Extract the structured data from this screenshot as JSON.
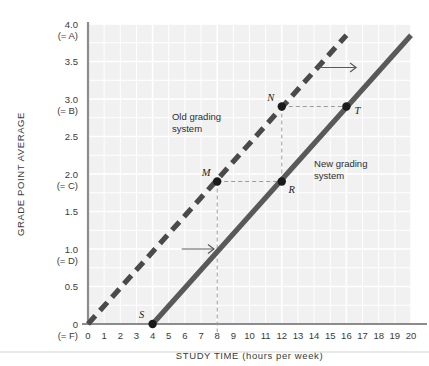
{
  "chart_data": {
    "type": "line",
    "title": "",
    "xlabel": "STUDY TIME (hours per week)",
    "ylabel": "GRADE POINT AVERAGE",
    "xlim": [
      0,
      20
    ],
    "ylim": [
      0,
      4.0
    ],
    "grid": true,
    "legend_position": "inline-annotations",
    "x_ticks": [
      "0",
      "1",
      "2",
      "3",
      "4",
      "5",
      "6",
      "7",
      "8",
      "9",
      "10",
      "11",
      "12",
      "13",
      "14",
      "15",
      "16",
      "17",
      "18",
      "19",
      "20"
    ],
    "x_tick_values": [
      0,
      1,
      2,
      3,
      4,
      5,
      6,
      7,
      8,
      9,
      10,
      11,
      12,
      13,
      14,
      15,
      16,
      17,
      18,
      19,
      20
    ],
    "y_ticks": [
      {
        "value": 4.0,
        "primary": "4.0",
        "secondary": "(= A)"
      },
      {
        "value": 3.5,
        "primary": "3.5",
        "secondary": ""
      },
      {
        "value": 3.0,
        "primary": "3.0",
        "secondary": "(= B)"
      },
      {
        "value": 2.5,
        "primary": "2.5",
        "secondary": ""
      },
      {
        "value": 2.0,
        "primary": "2.0",
        "secondary": "(= C)"
      },
      {
        "value": 1.5,
        "primary": "1.5",
        "secondary": ""
      },
      {
        "value": 1.0,
        "primary": "1.0",
        "secondary": "(= D)"
      },
      {
        "value": 0.5,
        "primary": "0.5",
        "secondary": ""
      },
      {
        "value": 0.0,
        "primary": "0",
        "secondary": "(= F)"
      }
    ],
    "series": [
      {
        "name": "Old grading system",
        "style": "dashed",
        "color": "#4a4a4a",
        "x": [
          0,
          16
        ],
        "values": [
          0,
          3.85
        ],
        "slope": 0.2408,
        "intercept": 0
      },
      {
        "name": "New grading system",
        "style": "solid",
        "color": "#595959",
        "x": [
          4,
          20
        ],
        "values": [
          0,
          3.85
        ],
        "slope": 0.2408,
        "intercept": -0.963
      }
    ],
    "points": [
      {
        "label": "S",
        "x": 4,
        "y": 0,
        "series": "New grading system"
      },
      {
        "label": "M",
        "x": 8,
        "y": 1.9,
        "series": "Old grading system"
      },
      {
        "label": "N",
        "x": 12,
        "y": 2.9,
        "series": "Old grading system"
      },
      {
        "label": "R",
        "x": 12,
        "y": 1.9,
        "series": "New grading system"
      },
      {
        "label": "T",
        "x": 16,
        "y": 2.9,
        "series": "New grading system"
      }
    ],
    "annotations": [
      {
        "text": "Old grading system",
        "line1": "Old grading",
        "line2": "system",
        "x": 5.2,
        "y": 2.72
      },
      {
        "text": "New grading system",
        "line1": "New grading",
        "line2": "system",
        "x": 14.0,
        "y": 2.1
      },
      {
        "text": "shift-arrow-upper",
        "kind": "arrow",
        "x1": 14.2,
        "x2": 16.6,
        "y": 3.42
      },
      {
        "text": "shift-arrow-lower",
        "kind": "arrow",
        "x1": 5.8,
        "x2": 7.8,
        "y": 1.0
      }
    ],
    "guide_lines": [
      {
        "from": "M",
        "to": "R",
        "orientation": "horizontal"
      },
      {
        "from": "N",
        "to": "T",
        "orientation": "horizontal"
      },
      {
        "from": "M",
        "to": "x-axis",
        "orientation": "vertical"
      },
      {
        "from": "N",
        "to": "R",
        "orientation": "vertical"
      }
    ]
  },
  "colors": {
    "plot_background": "#f1f1f1",
    "gridline": "#ffffff",
    "axis": "#8c8c8c",
    "old_line": "#4a4a4a",
    "new_line": "#595959",
    "guide_dash": "#9a9a9a",
    "text": "#3a3a3a",
    "divider": "#e2e2e2"
  }
}
